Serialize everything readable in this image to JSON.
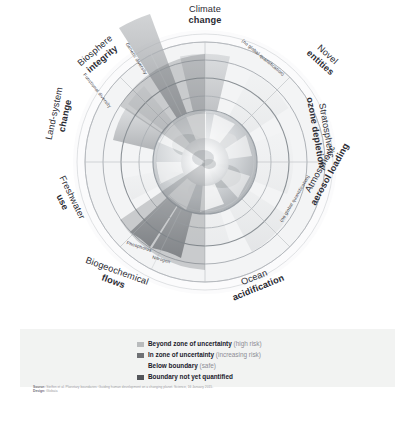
{
  "figure": {
    "type": "planetary-boundaries-wheel",
    "title": "Planetary boundaries",
    "center_graphic": "earth-globe"
  },
  "boundaries": [
    {
      "id": "climate-change",
      "top": "Climate",
      "bold": "change"
    },
    {
      "id": "novel-entities",
      "top": "Novel",
      "bold": "entities"
    },
    {
      "id": "stratospheric-ozone",
      "top": "Stratospheric",
      "bold": "ozone depletion"
    },
    {
      "id": "atmospheric-aerosol",
      "top": "Atmospheric",
      "bold": "aerosol loading"
    },
    {
      "id": "ocean-acidification",
      "top": "Ocean",
      "bold": "acidification"
    },
    {
      "id": "biogeochemical-flows",
      "top": "Biogeochemical",
      "bold": "flows"
    },
    {
      "id": "freshwater-use",
      "top": "Freshwater",
      "bold": "use"
    },
    {
      "id": "land-system-change",
      "top": "Land-system",
      "bold": "change"
    },
    {
      "id": "biosphere-integrity",
      "top": "Biosphere",
      "bold": "integrity"
    }
  ],
  "sublabels": {
    "genetic_diversity": "Genetic diversity",
    "functional_diversity": "Functional diversity",
    "novel_entities_note": "(no global quantification)",
    "aerosol_note": "(no global quantification)",
    "phosphorus": "Phosphorus",
    "nitrogen": "Nitrogen"
  },
  "legend": {
    "items": [
      {
        "swatch": "beyond-zone",
        "color": "#b9bbbd",
        "strong": "Beyond zone of uncertainty",
        "soft": "(high risk)"
      },
      {
        "swatch": "in-zone",
        "color": "#6f7175",
        "strong": "In zone of uncertainty",
        "soft": "(increasing risk)"
      },
      {
        "swatch": "below-boundary",
        "color": "transparent",
        "strong": "Below boundary",
        "soft": "(safe)"
      },
      {
        "swatch": "not-quantified",
        "color": "#53555a",
        "strong": "Boundary not yet quantified",
        "soft": ""
      }
    ]
  },
  "source": {
    "source_label": "Source:",
    "source_text": "Steffen et al. Planetary boundaries: Guiding human development on a changing planet. Science, 16 January 2015.",
    "design_label": "Design:",
    "design_text": "Globaïa"
  },
  "colors": {
    "band_background": "#f2f3f2",
    "page_background": "#ffffff",
    "label_text": "#2b2b33",
    "ring_line": "#9aa0a6"
  }
}
